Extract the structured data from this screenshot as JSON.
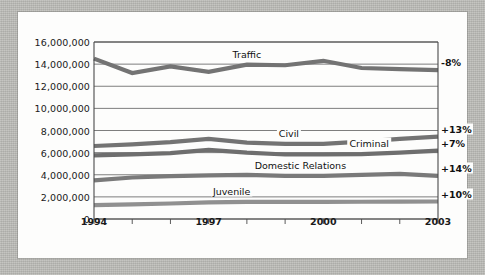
{
  "figure": {
    "background_color": "#fdfdfc",
    "page_background_color": "#bcbcb8",
    "axis_color": "#4a4a4a",
    "grid_color": "#6f6f6f"
  },
  "chart_data": {
    "type": "line",
    "title": "",
    "subtitle": "",
    "xlabel": "",
    "ylabel": "",
    "grid": "horizontal",
    "legend_position": "inline-labels",
    "x": [
      1994,
      1995,
      1996,
      1997,
      1998,
      1999,
      2000,
      2001,
      2002,
      2003
    ],
    "xtick_values": [
      1994,
      1997,
      2000,
      2003
    ],
    "xtick_labels": [
      "1994",
      "1997",
      "2000",
      "2003"
    ],
    "xlim": [
      1994,
      2003
    ],
    "ylim": [
      0,
      16000000
    ],
    "ytick_values": [
      0,
      2000000,
      4000000,
      6000000,
      8000000,
      10000000,
      12000000,
      14000000,
      16000000
    ],
    "ytick_labels": [
      "0",
      "2,000,000",
      "4,000,000",
      "6,000,000",
      "8,000,000",
      "10,000,000",
      "12,000,000",
      "14,000,000",
      "16,000,000"
    ],
    "series": [
      {
        "name": "Traffic",
        "color": "#737373",
        "change_label": "-8%",
        "label_x": 1998.0,
        "values": [
          14500000,
          13200000,
          13800000,
          13300000,
          13950000,
          13900000,
          14300000,
          13650000,
          13550000,
          13450000
        ]
      },
      {
        "name": "Civil",
        "color": "#737373",
        "change_label": "+13%",
        "label_x": 1999.1,
        "values": [
          6600000,
          6750000,
          6950000,
          7250000,
          6900000,
          6800000,
          6800000,
          7000000,
          7250000,
          7450000
        ]
      },
      {
        "name": "Criminal",
        "color": "#6e6e6e",
        "change_label": "+7%",
        "label_x": 2001.2,
        "values": [
          5750000,
          5850000,
          5950000,
          6250000,
          6000000,
          5830000,
          5830000,
          5870000,
          6000000,
          6180000
        ]
      },
      {
        "name": "Domestic Relations",
        "color": "#7a7a7a",
        "change_label": "+14%",
        "label_x": 1999.4,
        "values": [
          3500000,
          3750000,
          3880000,
          3950000,
          3980000,
          3900000,
          3900000,
          3980000,
          4080000,
          3900000
        ]
      },
      {
        "name": "Juvenile",
        "color": "#909090",
        "change_label": "+10%",
        "label_x": 1997.6,
        "values": [
          1250000,
          1330000,
          1400000,
          1500000,
          1540000,
          1550000,
          1555000,
          1560000,
          1570000,
          1580000
        ]
      }
    ]
  }
}
